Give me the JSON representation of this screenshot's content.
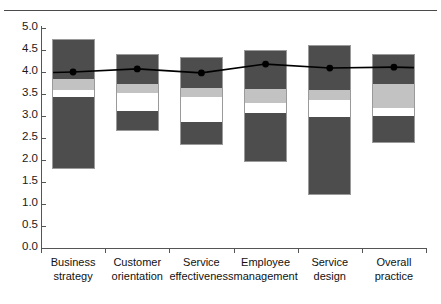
{
  "page": {
    "clipped_header_text": "",
    "rule_color": "#4a4a4a"
  },
  "chart_data": {
    "type": "bar",
    "title": "",
    "subtitle": "",
    "xlabel": "",
    "ylabel": "",
    "ylim": [
      0.0,
      5.0
    ],
    "grid": false,
    "legend_position": "none",
    "categories": [
      "Business strategy",
      "Customer orientation",
      "Service effectiveness",
      "Employee management",
      "Service design",
      "Overall practice"
    ],
    "category_lines": [
      [
        "Business",
        "strategy"
      ],
      [
        "Customer",
        "orientation"
      ],
      [
        "Service",
        "effectiveness"
      ],
      [
        "Employee",
        "management"
      ],
      [
        "Service",
        "design"
      ],
      [
        "Overall",
        "practice"
      ]
    ],
    "ytick_labels": [
      "0.0",
      "0.5",
      "1.0",
      "1.5",
      "2.0",
      "2.5",
      "3.0",
      "3.5",
      "4.0",
      "4.5",
      "5.0"
    ],
    "ytick_values": [
      0.0,
      0.5,
      1.0,
      1.5,
      2.0,
      2.5,
      3.0,
      3.5,
      4.0,
      4.5,
      5.0
    ],
    "series": [
      {
        "name": "Box range (min to max)",
        "kind": "box",
        "colors": {
          "whisker": "#4d4d4d",
          "upper_box": "#c2c2c2",
          "median_band": "#ffffff"
        },
        "values": [
          {
            "category": "Business strategy",
            "max": 4.75,
            "q3": 3.84,
            "median_top": 3.59,
            "median_bottom": 3.43,
            "min": 1.8
          },
          {
            "category": "Customer orientation",
            "max": 4.41,
            "q3": 3.73,
            "median_top": 3.52,
            "median_bottom": 3.11,
            "min": 2.66
          },
          {
            "category": "Service effectiveness",
            "max": 4.34,
            "q3": 3.64,
            "median_top": 3.43,
            "median_bottom": 2.86,
            "min": 2.34
          },
          {
            "category": "Employee management",
            "max": 4.5,
            "q3": 3.61,
            "median_top": 3.3,
            "median_bottom": 3.07,
            "min": 1.95
          },
          {
            "category": "Service design",
            "max": 4.61,
            "q3": 3.59,
            "median_top": 3.36,
            "median_bottom": 2.98,
            "min": 1.2
          },
          {
            "category": "Overall practice",
            "max": 4.41,
            "q3": 3.73,
            "median_top": 3.18,
            "median_bottom": 3.0,
            "min": 2.39
          }
        ]
      },
      {
        "name": "Mean",
        "kind": "line",
        "color": "#000000",
        "marker": "circle",
        "values": [
          4.0,
          4.07,
          3.98,
          4.18,
          4.09,
          4.11
        ]
      }
    ]
  }
}
